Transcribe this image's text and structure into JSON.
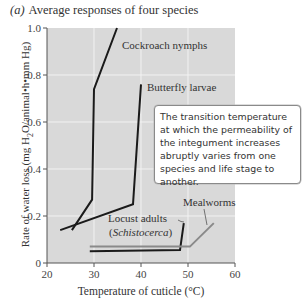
{
  "figure": {
    "panel_tag": "(a)",
    "title": "Average responses of four species",
    "callout_text": "The transition temperature at which the permeability of the integument increases abruptly varies from one species and life stage to another.",
    "labels": {
      "cockroach": "Cockroach nymphs",
      "butterfly": "Butterfly larvae",
      "locust_line1": "Locust adults",
      "locust_line2": "(Schistocerca)",
      "mealworms": "Mealworms"
    }
  },
  "chart_data": {
    "type": "line",
    "title": "Average responses of four species",
    "xlabel": "Temperature of cuticle (°C)",
    "ylabel": "Rate of water loss (mg H2O/animal•h•mm Hg)",
    "xlim": [
      20,
      60
    ],
    "ylim": [
      0,
      1.0
    ],
    "xticks": [
      20,
      30,
      40,
      50,
      60
    ],
    "yticks": [
      0,
      0.2,
      0.4,
      0.6,
      0.8,
      1.0
    ],
    "ytick_labels": [
      "0",
      "0.2",
      "0.4",
      "0.6",
      "0.8",
      "1.0"
    ],
    "grid": true,
    "background": "#d9d9d9",
    "series": [
      {
        "name": "Cockroach nymphs",
        "color": "#1a1a1a",
        "points": [
          [
            25.3,
            0.14
          ],
          [
            29.6,
            0.27
          ],
          [
            30.0,
            0.74
          ],
          [
            34.9,
            1.0
          ]
        ]
      },
      {
        "name": "Butterfly larvae",
        "color": "#1a1a1a",
        "points": [
          [
            22.8,
            0.14
          ],
          [
            38.3,
            0.25
          ],
          [
            40.0,
            0.76
          ]
        ]
      },
      {
        "name": "Locust adults (Schistocerca)",
        "color": "#1a1a1a",
        "points": [
          [
            29.1,
            0.05
          ],
          [
            48.3,
            0.055
          ],
          [
            49.1,
            0.17
          ]
        ]
      },
      {
        "name": "Mealworms",
        "color": "#8a8a8a",
        "points": [
          [
            29.1,
            0.07
          ],
          [
            50.4,
            0.07
          ],
          [
            55.5,
            0.17
          ]
        ]
      }
    ],
    "annotation": "The transition temperature at which the permeability of the integument increases abruptly varies from one species and life stage to another."
  }
}
